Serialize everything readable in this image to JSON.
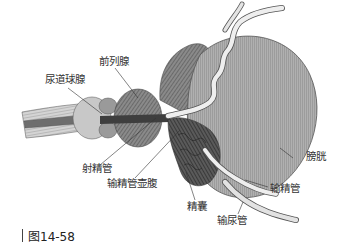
{
  "figure": {
    "caption": "图14-58",
    "colors": {
      "background": "#ffffff",
      "bladder": "#a9a9a9",
      "bladder_edge": "#555555",
      "tissue_dark": "#5a5a5a",
      "tissue_mid": "#8a8a8a",
      "tissue_light": "#d8d8d8",
      "duct": "#e8e8e8",
      "leader_line": "#333333",
      "text": "#333333"
    }
  },
  "labels": {
    "bulbourethral_gland": "尿道球腺",
    "prostate": "前列腺",
    "ejaculatory_duct": "射精管",
    "ampulla_of_vas_deferens": "输精管壶腹",
    "seminal_vesicle": "精囊",
    "bladder": "膀胱",
    "vas_deferens": "输精管",
    "ureter": "输尿管"
  }
}
